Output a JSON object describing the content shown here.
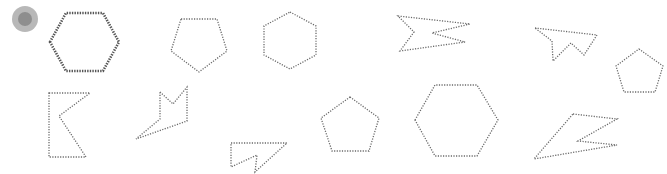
{
  "canvas": {
    "width": 667,
    "height": 174,
    "background": "#ffffff",
    "stroke_color": "#6a6a6a"
  },
  "cursor": {
    "cx": 25,
    "cy": 19,
    "outer_r": 13,
    "inner_r": 7,
    "outer_color": "#b8b8b8",
    "inner_color": "#8e8e8e"
  },
  "shapes": [
    {
      "name": "hexagon-selected",
      "type": "hexagon",
      "selected": true,
      "points": "50,42 66,13 103,13 119,42 103,71 66,71"
    },
    {
      "name": "pentagon-inverted",
      "type": "pentagon",
      "selected": false,
      "points": "181,19 217,19 227,51 199,72 171,51"
    },
    {
      "name": "hexagon-pointy",
      "type": "hexagon",
      "selected": false,
      "points": "290,12 316,26 316,55 290,69 264,55 264,26"
    },
    {
      "name": "zigzag-polygon-1",
      "type": "irregular",
      "selected": false,
      "points": "398,16 470,24 432,33 465,42 400,51 414,32"
    },
    {
      "name": "zigzag-polygon-2",
      "type": "irregular",
      "selected": false,
      "points": "535,28 597,35 584,55 571,43 553,61 552,41"
    },
    {
      "name": "pentagon-small",
      "type": "pentagon",
      "selected": false,
      "points": "639,49 663,66 655,92 624,92 616,66"
    },
    {
      "name": "k-shape-polygon",
      "type": "irregular",
      "selected": false,
      "points": "49,93 90,93 59,116 86,157 49,157"
    },
    {
      "name": "crown-polygon",
      "type": "irregular",
      "selected": false,
      "points": "160,92 173,104 187,87 187,121 136,139 160,119"
    },
    {
      "name": "triangle-notch-polygon",
      "type": "irregular",
      "selected": false,
      "points": "231,143 287,143 255,172 257,155 231,167"
    },
    {
      "name": "pentagon-medium",
      "type": "pentagon",
      "selected": false,
      "points": "350,97 379,118 369,151 332,151 321,118"
    },
    {
      "name": "hexagon-large",
      "type": "hexagon",
      "selected": false,
      "points": "415,120 435,85 477,85 498,120 477,156 435,156"
    },
    {
      "name": "lightning-polygon",
      "type": "irregular",
      "selected": false,
      "points": "573,114 617,119 578,141 617,145 534,159"
    }
  ]
}
